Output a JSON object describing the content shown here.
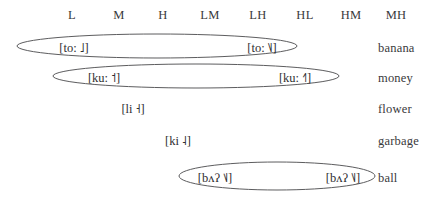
{
  "figure": {
    "column_headers": [
      {
        "label": "L",
        "x": 72
      },
      {
        "label": "M",
        "x": 119
      },
      {
        "label": "H",
        "x": 163
      },
      {
        "label": "LM",
        "x": 210
      },
      {
        "label": "LH",
        "x": 258
      },
      {
        "label": "HL",
        "x": 305
      },
      {
        "label": "HM",
        "x": 351
      },
      {
        "label": "MH",
        "x": 396
      }
    ],
    "rows": [
      {
        "gloss": "banana",
        "top": 38,
        "tokens": [
          {
            "text": "[to: ˩]",
            "x": 74,
            "column": "L"
          },
          {
            "text": "[to: ˥˩]",
            "x": 262,
            "column": "HL"
          }
        ],
        "ellipse": {
          "cx": 157,
          "cy": 46,
          "rx": 140,
          "ry": 12
        }
      },
      {
        "gloss": "money",
        "top": 68,
        "tokens": [
          {
            "text": "[ku: ˦]",
            "x": 104,
            "column": "M"
          },
          {
            "text": "[ku: ˧˥]",
            "x": 295,
            "column": "HM"
          }
        ],
        "ellipse": {
          "cx": 196,
          "cy": 76,
          "rx": 143,
          "ry": 12
        }
      },
      {
        "gloss": "flower",
        "top": 99,
        "tokens": [
          {
            "text": "[li ˧]",
            "x": 133,
            "column": "H"
          }
        ],
        "ellipse": null
      },
      {
        "gloss": "garbage",
        "top": 131,
        "tokens": [
          {
            "text": "[ki ˨]",
            "x": 178,
            "column": "LM"
          }
        ],
        "ellipse": null
      },
      {
        "gloss": "ball",
        "top": 168,
        "tokens": [
          {
            "text": "[bʌʔ ˦˩]",
            "x": 215,
            "column": "LH"
          },
          {
            "text": "[bʌʔ ˥˩]",
            "x": 343,
            "column": "MH"
          }
        ],
        "ellipse": {
          "cx": 277,
          "cy": 176,
          "rx": 98,
          "ry": 14
        }
      }
    ],
    "colors": {
      "background": "#ffffff",
      "text": "#39393b",
      "ellipse_stroke": "#4a4a4c"
    }
  }
}
